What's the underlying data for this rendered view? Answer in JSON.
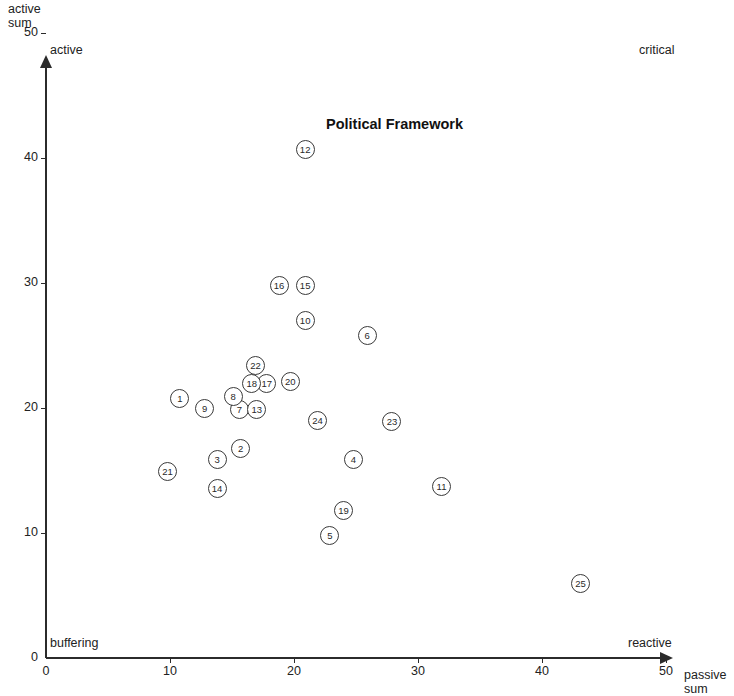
{
  "chart_data": {
    "type": "scatter",
    "title": "Political Framework",
    "xlabel": "passive sum",
    "ylabel": "active sum",
    "xlim": [
      0,
      50
    ],
    "ylim": [
      0,
      50
    ],
    "xticks": [
      0,
      10,
      20,
      30,
      40,
      50
    ],
    "yticks": [
      0,
      10,
      20,
      30,
      40,
      50
    ],
    "xtick_labels": [
      "0",
      "10",
      "20",
      "30",
      "40",
      "50"
    ],
    "ytick_labels": [
      "0",
      "10",
      "20",
      "30",
      "40",
      "50"
    ],
    "grid": false,
    "legend": "none",
    "quadrant_labels": {
      "top_left": "active",
      "top_right": "critical",
      "bottom_left": "buffering",
      "bottom_right": "reactive"
    },
    "point_labels_are_ids": true,
    "points": [
      {
        "id": "1",
        "x": 10.8,
        "y": 20.8
      },
      {
        "id": "2",
        "x": 15.7,
        "y": 16.8
      },
      {
        "id": "3",
        "x": 13.8,
        "y": 15.9
      },
      {
        "id": "4",
        "x": 24.8,
        "y": 15.9
      },
      {
        "id": "5",
        "x": 22.9,
        "y": 9.8
      },
      {
        "id": "6",
        "x": 25.9,
        "y": 25.8
      },
      {
        "id": "7",
        "x": 15.6,
        "y": 19.9
      },
      {
        "id": "8",
        "x": 15.1,
        "y": 20.9
      },
      {
        "id": "9",
        "x": 12.8,
        "y": 20.0
      },
      {
        "id": "10",
        "x": 20.9,
        "y": 27.0
      },
      {
        "id": "11",
        "x": 31.9,
        "y": 13.7
      },
      {
        "id": "12",
        "x": 20.9,
        "y": 40.7
      },
      {
        "id": "13",
        "x": 17.0,
        "y": 19.9
      },
      {
        "id": "14",
        "x": 13.8,
        "y": 13.6
      },
      {
        "id": "15",
        "x": 20.9,
        "y": 29.8
      },
      {
        "id": "16",
        "x": 18.8,
        "y": 29.8
      },
      {
        "id": "17",
        "x": 17.8,
        "y": 22.0
      },
      {
        "id": "18",
        "x": 16.6,
        "y": 22.0
      },
      {
        "id": "19",
        "x": 24.0,
        "y": 11.8
      },
      {
        "id": "20",
        "x": 19.7,
        "y": 22.1
      },
      {
        "id": "21",
        "x": 9.8,
        "y": 14.9
      },
      {
        "id": "22",
        "x": 16.9,
        "y": 23.4
      },
      {
        "id": "23",
        "x": 27.9,
        "y": 18.9
      },
      {
        "id": "24",
        "x": 21.9,
        "y": 19.0
      },
      {
        "id": "25",
        "x": 43.1,
        "y": 6.0
      }
    ]
  },
  "axis": {
    "y_title_line1": "active",
    "y_title_line2": "sum",
    "x_title_line1": "passive",
    "x_title_line2": "sum"
  }
}
